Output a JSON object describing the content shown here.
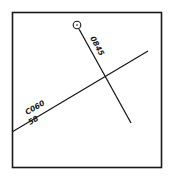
{
  "diagram": {
    "frame": {
      "x": 12,
      "y": 12,
      "width": 150,
      "height": 156,
      "stroke": "#1a1a1a"
    },
    "lines": [
      {
        "name": "track-0845",
        "x1": 77,
        "y1": 25,
        "x2": 131,
        "y2": 123,
        "label": "0845",
        "origin_marker": "circle"
      },
      {
        "name": "track-c060",
        "x1": 12,
        "y1": 132,
        "x2": 148,
        "y2": 51,
        "label_top": "C060",
        "label_bottom": "58"
      }
    ]
  }
}
